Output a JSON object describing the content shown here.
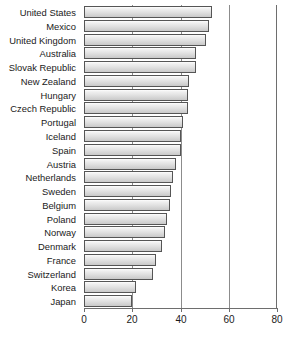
{
  "chart_data": {
    "type": "bar",
    "orientation": "horizontal",
    "title": "",
    "subtitle": "",
    "xlabel": "",
    "ylabel": "",
    "xlim": [
      0,
      80
    ],
    "ylim": null,
    "xticks": [
      0,
      20,
      40,
      60,
      80
    ],
    "xtick_labels": [
      "0",
      "20",
      "40",
      "60",
      "80"
    ],
    "grid": true,
    "gridlines_at": [
      20,
      40,
      60
    ],
    "legend": null,
    "legend_position": "none",
    "categories": [
      "United States",
      "Mexico",
      "United Kingdom",
      "Australia",
      "Slovak Republic",
      "New Zealand",
      "Hungary",
      "Czech Republic",
      "Portugal",
      "Iceland",
      "Spain",
      "Austria",
      "Netherlands",
      "Sweden",
      "Belgium",
      "Poland",
      "Norway",
      "Denmark",
      "France",
      "Switzerland",
      "Korea",
      "Japan"
    ],
    "values": [
      53,
      52,
      50.5,
      46.5,
      46.5,
      43.5,
      43,
      43,
      41,
      40,
      40,
      38,
      37,
      36,
      35.5,
      34.5,
      33.5,
      32.5,
      30,
      28.5,
      21.5,
      20
    ],
    "bar_face_color": "#e2e2e2",
    "bar_edge_color": "#555555",
    "axis_color": "#6e6e6e",
    "grid_color": "#8c8c8c",
    "text_color": "#1a1a1a"
  }
}
